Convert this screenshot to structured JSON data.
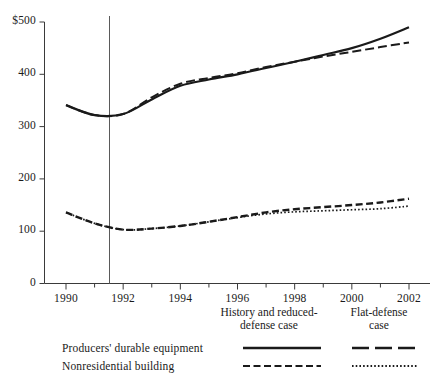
{
  "chart_data": {
    "type": "line",
    "title": "",
    "xlabel": "",
    "ylabel": "",
    "xlim": [
      1990,
      2002
    ],
    "ylim": [
      0,
      500
    ],
    "grid": false,
    "legend_position": "bottom",
    "yticks": [
      "$500",
      "400",
      "300",
      "200",
      "100",
      "0"
    ],
    "ytick_values": [
      500,
      400,
      300,
      200,
      100,
      0
    ],
    "xticks": [
      "1990",
      "1992",
      "1994",
      "1996",
      "1998",
      "2000",
      "2002"
    ],
    "xtick_values": [
      1990,
      1992,
      1994,
      1996,
      1998,
      2000,
      2002
    ],
    "xminor_values": [
      1991,
      1993,
      1995,
      1997,
      1999,
      2001
    ],
    "annotations": [
      {
        "name": "history-projection-divider",
        "type": "vline",
        "x": 1991.5
      }
    ],
    "x": [
      1990,
      1991,
      1992,
      1993,
      1994,
      1995,
      1996,
      1997,
      1998,
      1999,
      2000,
      2001,
      2002
    ],
    "series": [
      {
        "name": "Producers' durable equipment — History and reduced-defense case",
        "style": "solid",
        "values": [
          341,
          322,
          324,
          352,
          378,
          390,
          400,
          412,
          424,
          437,
          450,
          468,
          490
        ]
      },
      {
        "name": "Producers' durable equipment — Flat-defense case",
        "style": "long-dash",
        "values": [
          341,
          322,
          324,
          356,
          382,
          393,
          402,
          414,
          424,
          434,
          443,
          452,
          461
        ]
      },
      {
        "name": "Nonresidential building — History and reduced-defense case",
        "style": "short-dash",
        "values": [
          136,
          115,
          103,
          105,
          110,
          118,
          127,
          136,
          142,
          146,
          150,
          155,
          162
        ]
      },
      {
        "name": "Nonresidential building — Flat-defense case",
        "style": "dotted",
        "values": [
          136,
          115,
          103,
          105,
          110,
          118,
          126,
          133,
          137,
          139,
          141,
          143,
          148
        ]
      }
    ]
  },
  "legend": {
    "columns": [
      {
        "key": "col1",
        "label": "History and reduced-defense case",
        "line1": "History and reduced-",
        "line2": "defense case"
      },
      {
        "key": "col2",
        "label": "Flat-defense case",
        "line1": "Flat-defense",
        "line2": "case"
      }
    ],
    "rows": [
      {
        "key": "r1",
        "label": "Producers' durable equipment",
        "col1_style": "solid",
        "col2_style": "long-dash"
      },
      {
        "key": "r2",
        "label": "Nonresidential building",
        "col1_style": "short-dash",
        "col2_style": "dotted"
      }
    ]
  },
  "colors": {
    "ink": "#1a1a1a",
    "axis": "#555555",
    "background": "#ffffff"
  }
}
